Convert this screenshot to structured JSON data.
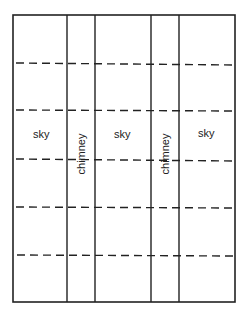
{
  "diagram": {
    "columns": [
      {
        "type": "sky",
        "label": "sky"
      },
      {
        "type": "chimney",
        "label": "chimney"
      },
      {
        "type": "sky",
        "label": "sky"
      },
      {
        "type": "chimney",
        "label": "chimney"
      },
      {
        "type": "sky",
        "label": "sky"
      }
    ],
    "dashed_rows": 5,
    "line_color": "#222222"
  }
}
